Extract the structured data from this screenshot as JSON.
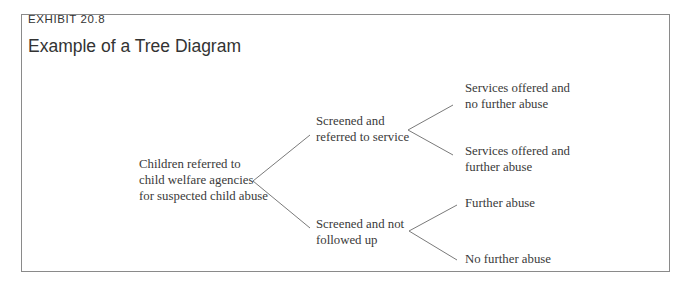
{
  "exhibit": {
    "label": "EXHIBIT 20.8",
    "title": "Example of a Tree Diagram"
  },
  "tree": {
    "root": {
      "lines": [
        "Children referred to",
        "child welfare agencies",
        "for suspected child abuse"
      ]
    },
    "level1": [
      {
        "lines": [
          "Screened and",
          "referred to service"
        ]
      },
      {
        "lines": [
          "Screened and not",
          "followed up"
        ]
      }
    ],
    "level2": [
      {
        "parent": 0,
        "lines": [
          "Services offered and",
          "no further abuse"
        ]
      },
      {
        "parent": 0,
        "lines": [
          "Services offered and",
          "further abuse"
        ]
      },
      {
        "parent": 1,
        "lines": [
          "Further abuse"
        ]
      },
      {
        "parent": 1,
        "lines": [
          "No further abuse"
        ]
      }
    ]
  },
  "colors": {
    "text": "#3a3a3a",
    "edge": "#7a7a7a",
    "border": "#8a8a8a"
  }
}
